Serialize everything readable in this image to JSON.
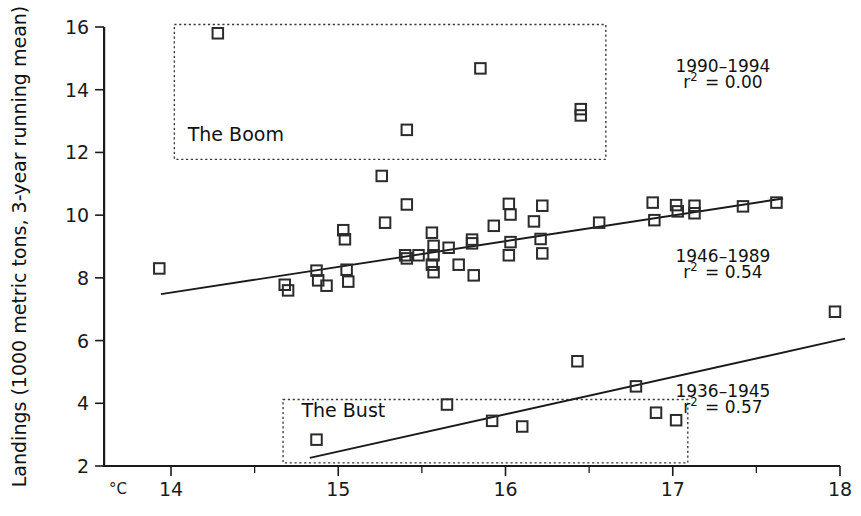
{
  "chart_data": {
    "type": "scatter",
    "title": "",
    "subtitle": "",
    "xlabel": "",
    "ylabel": "Landings (1000 metric tons, 3-year running mean)",
    "x_unit_label": "°C",
    "xlim": [
      13.6,
      18.0
    ],
    "ylim": [
      2,
      16
    ],
    "xticks": [
      14,
      15,
      16,
      17,
      18
    ],
    "xticklabels": [
      "14",
      "15",
      "16",
      "17",
      "18"
    ],
    "x_minor_ticks": [
      14.5,
      15.5,
      16.5,
      17.5
    ],
    "yticks": [
      2,
      4,
      6,
      8,
      10,
      12,
      14,
      16
    ],
    "yticklabels": [
      "2",
      "4",
      "6",
      "8",
      "10",
      "12",
      "14",
      "16"
    ],
    "grid": false,
    "legend_position": "inline-right",
    "marker": "open-square",
    "series": [
      {
        "name": "1946–1989",
        "r_squared": "0.54",
        "annotation_line1": "1946–1989",
        "annotation_line2_prefix": "r",
        "annotation_line2_sup": "2",
        "annotation_line2_suffix": "= 0.54",
        "annotation_x": 17.3,
        "annotation_y1": 8.5,
        "annotation_y2": 8.0,
        "fit_line": {
          "x0": 13.94,
          "y0": 7.48,
          "x1": 17.66,
          "y1": 10.53
        },
        "points": [
          [
            13.93,
            8.3
          ],
          [
            14.68,
            7.78
          ],
          [
            14.7,
            7.6
          ],
          [
            14.87,
            8.23
          ],
          [
            14.88,
            7.92
          ],
          [
            14.93,
            7.75
          ],
          [
            15.03,
            9.52
          ],
          [
            15.04,
            9.23
          ],
          [
            15.05,
            8.26
          ],
          [
            15.06,
            7.88
          ],
          [
            15.28,
            9.76
          ],
          [
            15.26,
            11.25
          ],
          [
            15.41,
            10.34
          ],
          [
            15.4,
            8.72
          ],
          [
            15.41,
            8.62
          ],
          [
            15.48,
            8.72
          ],
          [
            15.56,
            9.44
          ],
          [
            15.57,
            9.02
          ],
          [
            15.57,
            8.72
          ],
          [
            15.56,
            8.42
          ],
          [
            15.57,
            8.18
          ],
          [
            15.66,
            8.96
          ],
          [
            15.72,
            8.42
          ],
          [
            15.8,
            9.22
          ],
          [
            15.8,
            9.1
          ],
          [
            15.81,
            8.08
          ],
          [
            15.93,
            9.66
          ],
          [
            16.02,
            10.36
          ],
          [
            16.03,
            10.02
          ],
          [
            16.03,
            9.14
          ],
          [
            16.02,
            8.72
          ],
          [
            16.17,
            9.8
          ],
          [
            16.22,
            10.3
          ],
          [
            16.21,
            9.24
          ],
          [
            16.22,
            8.78
          ],
          [
            16.56,
            9.76
          ],
          [
            16.88,
            10.4
          ],
          [
            16.89,
            9.84
          ],
          [
            17.02,
            10.32
          ],
          [
            17.03,
            10.12
          ],
          [
            17.13,
            10.3
          ],
          [
            17.13,
            10.06
          ],
          [
            17.42,
            10.28
          ],
          [
            17.62,
            10.4
          ]
        ]
      },
      {
        "name": "1990–1994",
        "r_squared": "0.00",
        "annotation_line1": "1990–1994",
        "annotation_line2_prefix": "r",
        "annotation_line2_sup": "2",
        "annotation_line2_suffix": "= 0.00",
        "annotation_x": 17.3,
        "annotation_y1": 14.55,
        "annotation_y2": 14.05,
        "fit_line": null,
        "points": [
          [
            14.28,
            15.8
          ],
          [
            15.85,
            14.68
          ],
          [
            16.45,
            13.38
          ],
          [
            16.45,
            13.18
          ],
          [
            15.41,
            12.72
          ]
        ]
      },
      {
        "name": "1936–1945",
        "r_squared": "0.57",
        "annotation_line1": "1936–1945",
        "annotation_line2_prefix": "r",
        "annotation_line2_sup": "2",
        "annotation_line2_suffix": "= 0.57",
        "annotation_x": 17.3,
        "annotation_y1": 4.2,
        "annotation_y2": 3.7,
        "fit_line": {
          "x0": 14.83,
          "y0": 2.26,
          "x1": 18.03,
          "y1": 6.06
        },
        "points": [
          [
            14.87,
            2.84
          ],
          [
            15.65,
            3.96
          ],
          [
            15.92,
            3.44
          ],
          [
            16.1,
            3.26
          ],
          [
            16.43,
            5.34
          ],
          [
            16.78,
            4.54
          ],
          [
            16.9,
            3.7
          ],
          [
            17.02,
            3.46
          ],
          [
            17.97,
            6.92
          ]
        ]
      }
    ],
    "annotation_boxes": [
      {
        "label": "The Boom",
        "x0": 14.02,
        "x1": 16.6,
        "y0": 11.78,
        "y1": 16.08,
        "label_x": 14.1,
        "label_y": 12.35
      },
      {
        "label": "The Bust",
        "x0": 14.67,
        "x1": 17.09,
        "y0": 2.1,
        "y1": 4.12,
        "label_x": 14.78,
        "label_y": 3.55
      }
    ]
  }
}
